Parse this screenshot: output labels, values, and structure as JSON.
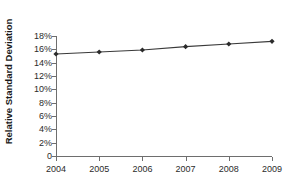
{
  "chart_data": {
    "type": "line",
    "title": "",
    "xlabel": "",
    "ylabel": "Relative Standard Deviation",
    "categories": [
      "2004",
      "2005",
      "2006",
      "2007",
      "2008",
      "2009"
    ],
    "x": [
      2004,
      2005,
      2006,
      2007,
      2008,
      2009
    ],
    "values": [
      15.3,
      15.6,
      15.9,
      16.4,
      16.8,
      17.2
    ],
    "series": [
      {
        "name": "Relative Standard Deviation",
        "values": [
          15.3,
          15.6,
          15.9,
          16.4,
          16.8,
          17.2
        ]
      }
    ],
    "ylim": [
      0,
      18
    ],
    "xlim": [
      2004,
      2009
    ],
    "y_tick_values": [
      0,
      2,
      4,
      6,
      8,
      10,
      12,
      14,
      16,
      18
    ],
    "y_tick_labels": [
      "0",
      "2%",
      "4%",
      "6%",
      "8%",
      "10%",
      "12%",
      "14%",
      "16%",
      "18%"
    ],
    "x_tick_labels": [
      "2004",
      "2005",
      "2006",
      "2007",
      "2008",
      "2009"
    ],
    "grid": false,
    "legend": false,
    "legend_position": "none",
    "marker": "diamond",
    "line_color": "#3a3a3a",
    "marker_color": "#2b2b2b",
    "axis_color": "#6e6e6e",
    "background_color": "#ffffff"
  }
}
